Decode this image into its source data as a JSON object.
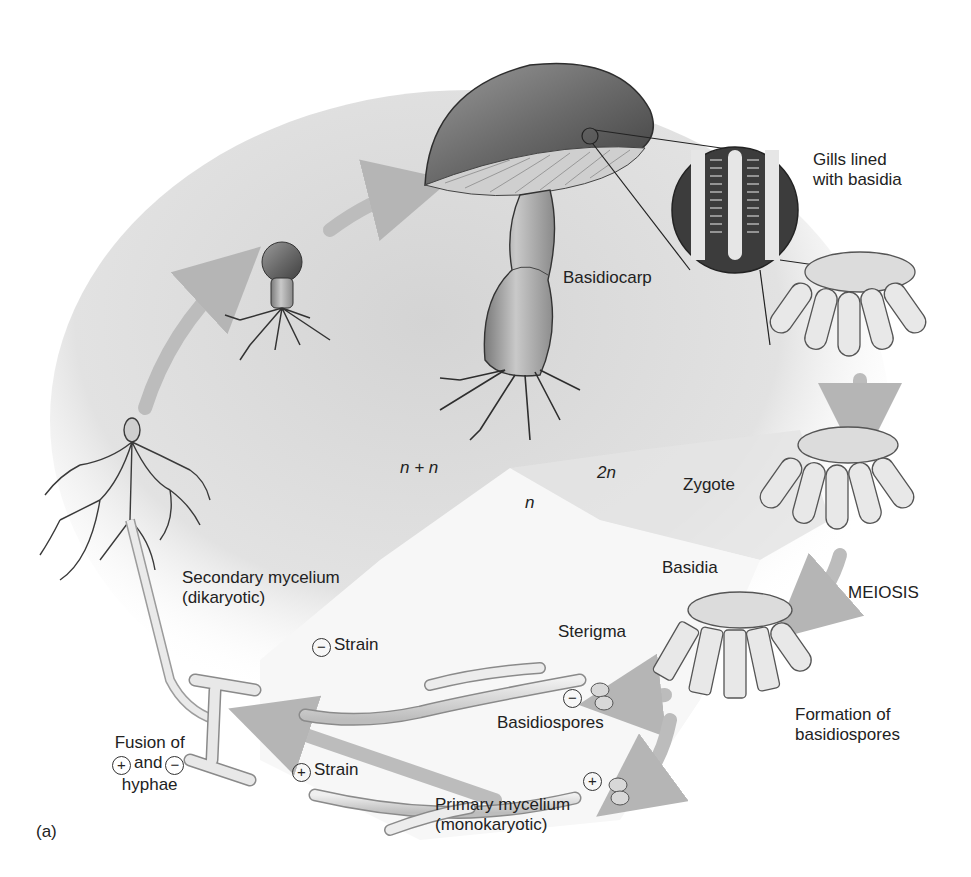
{
  "diagram": {
    "panel_label": "(a)",
    "colors": {
      "background": "#ffffff",
      "dikaryotic_region": "#d6d6d6",
      "diploid_region": "#e6e6e6",
      "haploid_region": "#f6f6f6",
      "arrow": "#b9b9b9",
      "cap_dark": "#5a5a5a",
      "ink": "#222222"
    },
    "phases": {
      "dikaryotic": "n + n",
      "diploid": "2n",
      "haploid": "n"
    },
    "labels": {
      "gills_line1": "Gills lined",
      "gills_line2": "with basidia",
      "basidiocarp": "Basidiocarp",
      "zygote": "Zygote",
      "basidia": "Basidia",
      "meiosis": "MEIOSIS",
      "sterigma": "Sterigma",
      "formation_line1": "Formation of",
      "formation_line2": "basidiospores",
      "basidiospores": "Basidiospores",
      "minus_strain": "Strain",
      "plus_strain": "Strain",
      "secondary_line1": "Secondary mycelium",
      "secondary_line2": "(dikaryotic)",
      "primary_line1": "Primary mycelium",
      "primary_line2": "(monokaryotic)",
      "fusion_line1": "Fusion of",
      "fusion_and": "and",
      "fusion_line3": "hyphae"
    },
    "symbols": {
      "plus": "+",
      "minus": "−"
    },
    "stages": [
      "Secondary mycelium (dikaryotic)",
      "Button stage",
      "Basidiocarp",
      "Gills lined with basidia",
      "Zygote",
      "Basidia / MEIOSIS",
      "Formation of basidiospores",
      "Basidiospores",
      "Primary mycelium (monokaryotic)",
      "Fusion of + and − hyphae"
    ]
  }
}
